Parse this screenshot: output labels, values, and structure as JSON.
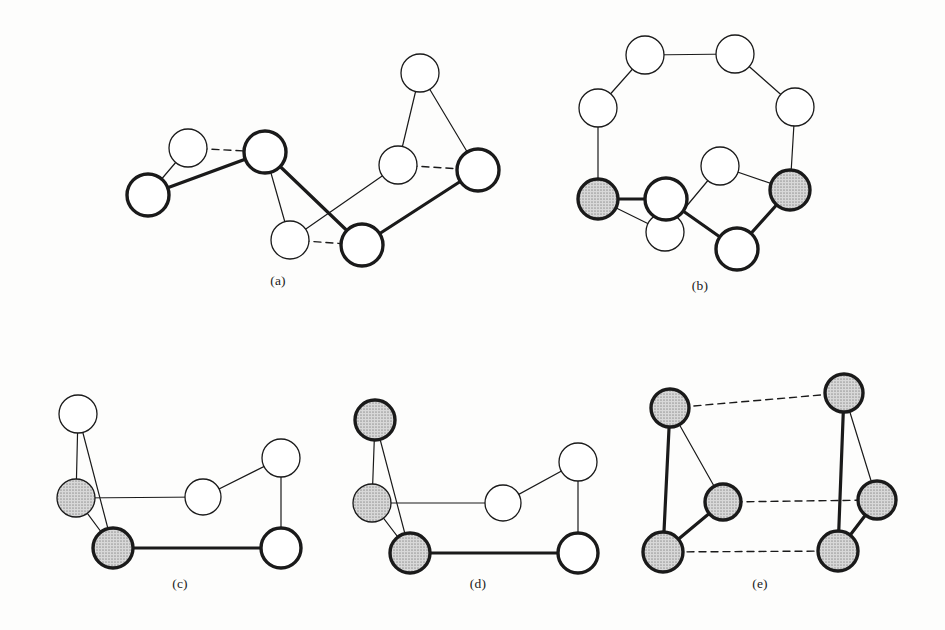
{
  "figure": {
    "background_color": "#fdfdfc",
    "node_fill_white": "#ffffff",
    "node_fill_shaded": "#c9c9c9",
    "stroke_color": "#1a1a1a",
    "thin_stroke_width": 1.3,
    "bold_stroke_width": 3.4,
    "edge_thin_width": 1.2,
    "edge_bold_width": 3.2,
    "dash_pattern": "7,5"
  },
  "panels": [
    {
      "id": "a",
      "caption": "(a)",
      "caption_pos": {
        "x": 278,
        "y": 285
      },
      "nodes": [
        {
          "name": "a-n1",
          "x": 148,
          "y": 195,
          "r": 21,
          "fill": "white",
          "border": "bold"
        },
        {
          "name": "a-n2",
          "x": 188,
          "y": 148,
          "r": 19,
          "fill": "white",
          "border": "thin"
        },
        {
          "name": "a-n3",
          "x": 265,
          "y": 152,
          "r": 21,
          "fill": "white",
          "border": "bold"
        },
        {
          "name": "a-n4",
          "x": 290,
          "y": 240,
          "r": 19,
          "fill": "white",
          "border": "thin"
        },
        {
          "name": "a-n5",
          "x": 362,
          "y": 245,
          "r": 21,
          "fill": "white",
          "border": "bold"
        },
        {
          "name": "a-n6",
          "x": 420,
          "y": 73,
          "r": 19,
          "fill": "white",
          "border": "thin"
        },
        {
          "name": "a-n7",
          "x": 398,
          "y": 165,
          "r": 19,
          "fill": "white",
          "border": "thin"
        },
        {
          "name": "a-n8",
          "x": 478,
          "y": 170,
          "r": 21,
          "fill": "white",
          "border": "bold"
        }
      ],
      "edges": [
        {
          "from": 0,
          "to": 1,
          "style": "thin"
        },
        {
          "from": 0,
          "to": 2,
          "style": "bold"
        },
        {
          "from": 1,
          "to": 2,
          "style": "dashed"
        },
        {
          "from": 2,
          "to": 3,
          "style": "thin"
        },
        {
          "from": 2,
          "to": 4,
          "style": "bold"
        },
        {
          "from": 3,
          "to": 4,
          "style": "dashed"
        },
        {
          "from": 3,
          "to": 6,
          "style": "thin"
        },
        {
          "from": 4,
          "to": 7,
          "style": "bold"
        },
        {
          "from": 5,
          "to": 6,
          "style": "thin"
        },
        {
          "from": 5,
          "to": 7,
          "style": "thin"
        },
        {
          "from": 6,
          "to": 7,
          "style": "dashed"
        }
      ]
    },
    {
      "id": "b",
      "caption": "(b)",
      "caption_pos": {
        "x": 700,
        "y": 290
      },
      "nodes": [
        {
          "name": "b-n1",
          "x": 645,
          "y": 55,
          "r": 19,
          "fill": "white",
          "border": "thin"
        },
        {
          "name": "b-n2",
          "x": 735,
          "y": 54,
          "r": 19,
          "fill": "white",
          "border": "thin"
        },
        {
          "name": "b-n3",
          "x": 598,
          "y": 108,
          "r": 19,
          "fill": "white",
          "border": "thin"
        },
        {
          "name": "b-n4",
          "x": 795,
          "y": 107,
          "r": 19,
          "fill": "white",
          "border": "thin"
        },
        {
          "name": "b-n5",
          "x": 598,
          "y": 199,
          "r": 20,
          "fill": "shaded",
          "border": "bold"
        },
        {
          "name": "b-n6",
          "x": 790,
          "y": 190,
          "r": 20,
          "fill": "shaded",
          "border": "bold"
        },
        {
          "name": "b-n7",
          "x": 665,
          "y": 232,
          "r": 19,
          "fill": "white",
          "border": "thin"
        },
        {
          "name": "b-n8",
          "x": 720,
          "y": 166,
          "r": 19,
          "fill": "white",
          "border": "thin"
        },
        {
          "name": "b-n9",
          "x": 666,
          "y": 199,
          "r": 21,
          "fill": "white",
          "border": "bold"
        },
        {
          "name": "b-n10",
          "x": 737,
          "y": 249,
          "r": 21,
          "fill": "white",
          "border": "bold"
        }
      ],
      "edges": [
        {
          "from": 0,
          "to": 1,
          "style": "thin"
        },
        {
          "from": 0,
          "to": 2,
          "style": "thin"
        },
        {
          "from": 1,
          "to": 3,
          "style": "thin"
        },
        {
          "from": 2,
          "to": 4,
          "style": "thin"
        },
        {
          "from": 3,
          "to": 5,
          "style": "thin"
        },
        {
          "from": 4,
          "to": 6,
          "style": "thin"
        },
        {
          "from": 4,
          "to": 8,
          "style": "bold"
        },
        {
          "from": 6,
          "to": 7,
          "style": "thin"
        },
        {
          "from": 7,
          "to": 5,
          "style": "thin"
        },
        {
          "from": 8,
          "to": 9,
          "style": "bold"
        },
        {
          "from": 9,
          "to": 5,
          "style": "bold"
        }
      ]
    },
    {
      "id": "c",
      "caption": "(c)",
      "caption_pos": {
        "x": 180,
        "y": 588
      },
      "nodes": [
        {
          "name": "c-n1",
          "x": 78,
          "y": 414,
          "r": 19,
          "fill": "white",
          "border": "thin"
        },
        {
          "name": "c-n2",
          "x": 76,
          "y": 498,
          "r": 19,
          "fill": "shaded",
          "border": "thin"
        },
        {
          "name": "c-n3",
          "x": 113,
          "y": 548,
          "r": 20,
          "fill": "shaded",
          "border": "bold"
        },
        {
          "name": "c-n4",
          "x": 203,
          "y": 497,
          "r": 18,
          "fill": "white",
          "border": "thin"
        },
        {
          "name": "c-n5",
          "x": 281,
          "y": 458,
          "r": 19,
          "fill": "white",
          "border": "thin"
        },
        {
          "name": "c-n6",
          "x": 281,
          "y": 548,
          "r": 20,
          "fill": "white",
          "border": "bold"
        }
      ],
      "edges": [
        {
          "from": 0,
          "to": 1,
          "style": "thin"
        },
        {
          "from": 0,
          "to": 2,
          "style": "thin"
        },
        {
          "from": 1,
          "to": 2,
          "style": "thin"
        },
        {
          "from": 1,
          "to": 3,
          "style": "thin"
        },
        {
          "from": 3,
          "to": 4,
          "style": "thin"
        },
        {
          "from": 4,
          "to": 5,
          "style": "thin"
        },
        {
          "from": 2,
          "to": 5,
          "style": "bold"
        }
      ]
    },
    {
      "id": "d",
      "caption": "(d)",
      "caption_pos": {
        "x": 478,
        "y": 588
      },
      "nodes": [
        {
          "name": "d-n1",
          "x": 375,
          "y": 420,
          "r": 20,
          "fill": "shaded",
          "border": "bold"
        },
        {
          "name": "d-n2",
          "x": 372,
          "y": 503,
          "r": 19,
          "fill": "shaded",
          "border": "thin"
        },
        {
          "name": "d-n3",
          "x": 410,
          "y": 553,
          "r": 20,
          "fill": "shaded",
          "border": "bold"
        },
        {
          "name": "d-n4",
          "x": 503,
          "y": 503,
          "r": 18,
          "fill": "white",
          "border": "thin"
        },
        {
          "name": "d-n5",
          "x": 578,
          "y": 462,
          "r": 19,
          "fill": "white",
          "border": "thin"
        },
        {
          "name": "d-n6",
          "x": 578,
          "y": 553,
          "r": 20,
          "fill": "white",
          "border": "bold"
        }
      ],
      "edges": [
        {
          "from": 0,
          "to": 1,
          "style": "thin"
        },
        {
          "from": 0,
          "to": 2,
          "style": "thin"
        },
        {
          "from": 1,
          "to": 2,
          "style": "thin"
        },
        {
          "from": 1,
          "to": 3,
          "style": "thin"
        },
        {
          "from": 3,
          "to": 4,
          "style": "thin"
        },
        {
          "from": 4,
          "to": 5,
          "style": "thin"
        },
        {
          "from": 2,
          "to": 5,
          "style": "bold"
        }
      ]
    },
    {
      "id": "e",
      "caption": "(e)",
      "caption_pos": {
        "x": 760,
        "y": 588
      },
      "nodes": [
        {
          "name": "e-n1",
          "x": 670,
          "y": 408,
          "r": 19,
          "fill": "shaded",
          "border": "bold"
        },
        {
          "name": "e-n2",
          "x": 723,
          "y": 502,
          "r": 18,
          "fill": "shaded",
          "border": "bold"
        },
        {
          "name": "e-n3",
          "x": 663,
          "y": 552,
          "r": 20,
          "fill": "shaded",
          "border": "bold"
        },
        {
          "name": "e-n4",
          "x": 844,
          "y": 393,
          "r": 19,
          "fill": "shaded",
          "border": "bold"
        },
        {
          "name": "e-n5",
          "x": 877,
          "y": 500,
          "r": 19,
          "fill": "shaded",
          "border": "bold"
        },
        {
          "name": "e-n6",
          "x": 838,
          "y": 551,
          "r": 20,
          "fill": "shaded",
          "border": "bold"
        }
      ],
      "edges": [
        {
          "from": 0,
          "to": 2,
          "style": "bold"
        },
        {
          "from": 0,
          "to": 1,
          "style": "thin"
        },
        {
          "from": 1,
          "to": 2,
          "style": "bold"
        },
        {
          "from": 3,
          "to": 5,
          "style": "bold"
        },
        {
          "from": 3,
          "to": 4,
          "style": "thin"
        },
        {
          "from": 4,
          "to": 5,
          "style": "bold"
        },
        {
          "from": 0,
          "to": 3,
          "style": "dashed"
        },
        {
          "from": 1,
          "to": 4,
          "style": "dashed"
        },
        {
          "from": 2,
          "to": 5,
          "style": "dashed"
        }
      ]
    }
  ]
}
